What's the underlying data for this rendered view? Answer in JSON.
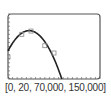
{
  "chart_data": {
    "type": "scatter",
    "title": "",
    "xlabel": "",
    "ylabel": "",
    "window_label": "[0, 20, 70,000, 150,000]",
    "xlim": [
      0,
      20
    ],
    "ylim": [
      70000,
      150000
    ],
    "grid": false,
    "tick_marks": {
      "x_step": 1,
      "y_step": 5000
    },
    "series": [
      {
        "name": "data points",
        "kind": "scatter",
        "marker": "square",
        "x": [
          0,
          3,
          5,
          8,
          10
        ],
        "y": [
          97000,
          125000,
          129000,
          111000,
          102000
        ]
      },
      {
        "name": "quadratic fit",
        "kind": "line",
        "vertex": [
          4.6,
          129500
        ],
        "x": [
          0,
          2,
          4,
          4.6,
          6,
          8,
          10,
          11.7
        ],
        "y": [
          97000,
          115000,
          128500,
          129500,
          125500,
          108000,
          90000,
          70000
        ]
      }
    ],
    "colors": {
      "frame": "#555555",
      "curve": "#222222",
      "points": "#888888"
    }
  }
}
